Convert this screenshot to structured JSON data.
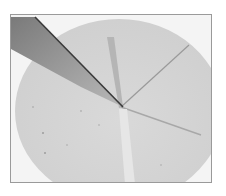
{
  "image": {
    "description": "Grayscale photo of a round flat disc (dough/tortilla) being sliced with a knife; radial cut lines from center",
    "caption": "Knife cutting a round disc into wedges",
    "colors": {
      "background": "#ffffff",
      "frame_border": "#9a9a9a",
      "disc": "#d6d6d6",
      "knife_blade": "#8c8c8c",
      "knife_edge": "#3a3a3a",
      "cut_line": "#9e9e9e"
    }
  }
}
